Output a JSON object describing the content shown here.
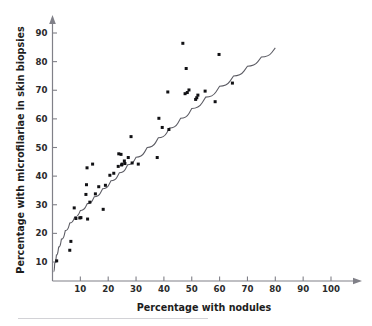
{
  "figure": {
    "background_color": "#ffffff",
    "axis_color": "#808088",
    "point_color": "#111114",
    "curve_color": "#5b5b63",
    "footer_rule_color": "#d2d2d6"
  },
  "axes": {
    "x_title": "Percentage with nodules",
    "y_title": "Percentage with microfilariae in skin biopsies",
    "x_ticks": [
      "10",
      "20",
      "30",
      "40",
      "50",
      "60",
      "70",
      "80",
      "90",
      "100"
    ],
    "y_ticks": [
      "10",
      "20",
      "30",
      "40",
      "50",
      "60",
      "70",
      "80",
      "90"
    ]
  },
  "chart_data": {
    "type": "scatter",
    "title": "",
    "xlabel": "Percentage with nodules",
    "ylabel": "Percentage with microfilariae in skin biopsies",
    "xlim": [
      0,
      105
    ],
    "ylim": [
      0,
      95
    ],
    "x_ticks": [
      10,
      20,
      30,
      40,
      50,
      60,
      70,
      80,
      90,
      100
    ],
    "y_ticks": [
      10,
      20,
      30,
      40,
      50,
      60,
      70,
      80,
      90
    ],
    "grid": false,
    "legend": null,
    "series": [
      {
        "name": "Communities",
        "marker": "square-dot",
        "points": [
          [
            1.5,
            10.4
          ],
          [
            6.2,
            14.1
          ],
          [
            6.6,
            17.2
          ],
          [
            7.8,
            28.9
          ],
          [
            8.4,
            25.2
          ],
          [
            9.8,
            25.4
          ],
          [
            10.2,
            25.5
          ],
          [
            12.0,
            33.6
          ],
          [
            12.2,
            37.0
          ],
          [
            12.4,
            42.9
          ],
          [
            12.6,
            25.0
          ],
          [
            13.4,
            30.9
          ],
          [
            14.4,
            44.2
          ],
          [
            15.4,
            33.8
          ],
          [
            16.6,
            36.3
          ],
          [
            18.2,
            28.4
          ],
          [
            19.0,
            36.8
          ],
          [
            20.6,
            40.3
          ],
          [
            22.0,
            41.0
          ],
          [
            23.6,
            43.4
          ],
          [
            23.8,
            47.8
          ],
          [
            24.6,
            47.6
          ],
          [
            24.8,
            43.9
          ],
          [
            25.0,
            44.2
          ],
          [
            25.8,
            45.3
          ],
          [
            26.0,
            44.4
          ],
          [
            27.2,
            46.5
          ],
          [
            28.2,
            53.8
          ],
          [
            28.6,
            44.6
          ],
          [
            30.8,
            44.2
          ],
          [
            37.6,
            46.5
          ],
          [
            38.2,
            60.2
          ],
          [
            39.4,
            57.0
          ],
          [
            41.4,
            69.4
          ],
          [
            41.8,
            56.3
          ],
          [
            46.8,
            86.4
          ],
          [
            47.6,
            68.8
          ],
          [
            48.0,
            77.6
          ],
          [
            48.4,
            69.2
          ],
          [
            49.0,
            70.1
          ],
          [
            51.4,
            66.8
          ],
          [
            51.8,
            67.4
          ],
          [
            52.2,
            68.3
          ],
          [
            54.8,
            69.7
          ],
          [
            58.4,
            66.0
          ],
          [
            59.8,
            82.5
          ],
          [
            64.6,
            72.5
          ]
        ]
      }
    ],
    "fit_curve": {
      "name": "Fitted curve",
      "points": [
        [
          0.4,
          6.6
        ],
        [
          0.8,
          9.6
        ],
        [
          1.4,
          12.4
        ],
        [
          2.2,
          15.2
        ],
        [
          3.2,
          18.0
        ],
        [
          4.6,
          21.0
        ],
        [
          6.2,
          23.6
        ],
        [
          8.0,
          25.8
        ],
        [
          10.0,
          28.0
        ],
        [
          12.5,
          30.4
        ],
        [
          15.0,
          32.8
        ],
        [
          18.0,
          35.6
        ],
        [
          21.0,
          38.4
        ],
        [
          24.0,
          41.2
        ],
        [
          27.0,
          44.0
        ],
        [
          30.0,
          46.6
        ],
        [
          34.0,
          50.0
        ],
        [
          38.0,
          53.4
        ],
        [
          42.0,
          56.8
        ],
        [
          46.0,
          60.2
        ],
        [
          50.0,
          63.6
        ],
        [
          55.0,
          67.6
        ],
        [
          60.0,
          71.4
        ],
        [
          65.0,
          75.0
        ],
        [
          70.0,
          78.4
        ],
        [
          75.0,
          81.6
        ],
        [
          80.0,
          84.8
        ]
      ]
    }
  }
}
